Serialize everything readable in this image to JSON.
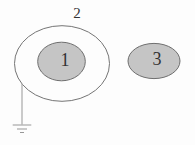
{
  "diagram": {
    "labels": {
      "region1": "1",
      "region2": "2",
      "region3": "3"
    },
    "icons": {
      "ground": "earth-ground-icon"
    },
    "colors": {
      "background": "#fdfdfd",
      "shaded_fill": "#c5c5c5",
      "shaded_stroke": "#6f6f6f",
      "outline_stroke": "#757575",
      "wire": "#979797",
      "text": "#333333"
    }
  }
}
